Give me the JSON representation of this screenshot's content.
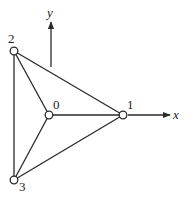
{
  "diagram": {
    "type": "graph",
    "nodes": [
      {
        "id": "0",
        "label": "0",
        "x": 49,
        "y": 115,
        "label_dx": 4,
        "label_dy": -6
      },
      {
        "id": "1",
        "label": "1",
        "x": 123,
        "y": 115,
        "label_dx": 4,
        "label_dy": -6
      },
      {
        "id": "2",
        "label": "2",
        "x": 14,
        "y": 51,
        "label_dx": -6,
        "label_dy": -8
      },
      {
        "id": "3",
        "label": "3",
        "x": 14,
        "y": 180,
        "label_dx": 5,
        "label_dy": 11
      }
    ],
    "edges": [
      [
        "2",
        "3"
      ],
      [
        "2",
        "0"
      ],
      [
        "2",
        "1"
      ],
      [
        "3",
        "0"
      ],
      [
        "3",
        "1"
      ],
      [
        "0",
        "1"
      ]
    ],
    "axes": {
      "x": {
        "label": "x",
        "from": [
          128,
          115
        ],
        "to": [
          170,
          115
        ]
      },
      "y": {
        "label": "y",
        "from": [
          51,
          67
        ],
        "to": [
          51,
          22
        ]
      }
    },
    "colors": {
      "stroke": "#2a2a2a",
      "background": "#ffffff"
    }
  }
}
